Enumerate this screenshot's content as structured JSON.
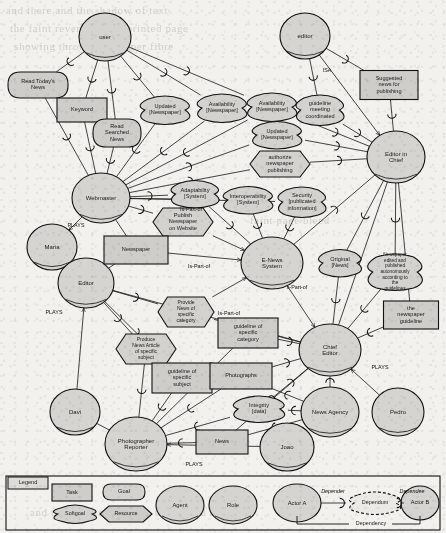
{
  "diagram": {
    "notation": "i-star",
    "colors": {
      "node_fill": "#d4d2ce",
      "stroke": "#121212",
      "page_bg": "#f2f1ee"
    }
  },
  "nodes": [
    {
      "id": "user",
      "label": "user",
      "type": "actor",
      "x": 105,
      "y": 37,
      "rx": 26,
      "ry": 24
    },
    {
      "id": "editor_role_top",
      "label": "editor",
      "type": "actor",
      "x": 305,
      "y": 36,
      "rx": 25,
      "ry": 23
    },
    {
      "id": "webmaster",
      "label": "Webmaster",
      "type": "actor",
      "x": 101,
      "y": 198,
      "rx": 29,
      "ry": 25
    },
    {
      "id": "editor_in_chief",
      "label": "Editor in\nChief",
      "type": "actor",
      "x": 396,
      "y": 157,
      "rx": 29,
      "ry": 26
    },
    {
      "id": "maria",
      "label": "Maria",
      "type": "agent",
      "x": 52,
      "y": 247,
      "rx": 25,
      "ry": 23
    },
    {
      "id": "editor_actor",
      "label": "Editor",
      "type": "actor",
      "x": 86,
      "y": 283,
      "rx": 28,
      "ry": 25
    },
    {
      "id": "enews",
      "label": "E-News\nSystem",
      "type": "actor",
      "x": 272,
      "y": 263,
      "rx": 31,
      "ry": 26
    },
    {
      "id": "chief_editor",
      "label": "Chief Editor",
      "type": "actor",
      "x": 330,
      "y": 350,
      "rx": 31,
      "ry": 26
    },
    {
      "id": "davi",
      "label": "Davi",
      "type": "agent",
      "x": 75,
      "y": 412,
      "rx": 25,
      "ry": 23
    },
    {
      "id": "photographer",
      "label": "Photographer\nReporter",
      "type": "actor",
      "x": 136,
      "y": 444,
      "rx": 31,
      "ry": 27
    },
    {
      "id": "news_agency",
      "label": "News Agency",
      "type": "actor",
      "x": 330,
      "y": 412,
      "rx": 29,
      "ry": 25
    },
    {
      "id": "pedro",
      "label": "Pedro",
      "type": "agent",
      "x": 398,
      "y": 412,
      "rx": 26,
      "ry": 24
    },
    {
      "id": "joao",
      "label": "Joao",
      "type": "agent",
      "x": 287,
      "y": 447,
      "rx": 27,
      "ry": 24
    },
    {
      "id": "read_today",
      "label": "Read Today's\nNews",
      "type": "task",
      "x": 38,
      "y": 85,
      "w": 60,
      "h": 26
    },
    {
      "id": "keyword",
      "label": "Keyword",
      "type": "resource",
      "x": 82,
      "y": 110,
      "w": 50,
      "h": 24
    },
    {
      "id": "read_searched",
      "label": "Read\nSearched\nNews",
      "type": "task",
      "x": 117,
      "y": 133,
      "w": 48,
      "h": 28
    },
    {
      "id": "updated_news_1",
      "label": "Updated\n[Newspaper]",
      "type": "softgoal",
      "x": 165,
      "y": 110,
      "w": 56,
      "h": 26
    },
    {
      "id": "avail_news_1",
      "label": "Availability\n[Newspaper]",
      "type": "softgoal",
      "x": 222,
      "y": 108,
      "w": 56,
      "h": 26
    },
    {
      "id": "avail_news_2",
      "label": "Availability\n[Newspaper]",
      "type": "softgoal",
      "x": 272,
      "y": 107,
      "w": 56,
      "h": 26
    },
    {
      "id": "updated_news_2",
      "label": "Updated\n[Newspaper]",
      "type": "softgoal",
      "x": 277,
      "y": 135,
      "w": 56,
      "h": 25
    },
    {
      "id": "guideline_meet",
      "label": "guideline\nmeeting\ncoordinated",
      "type": "softgoal",
      "x": 320,
      "y": 110,
      "w": 54,
      "h": 28
    },
    {
      "id": "suggested_news",
      "label": "Suggested\nnews for\npublishing",
      "type": "resource",
      "x": 389,
      "y": 85,
      "w": 58,
      "h": 29
    },
    {
      "id": "authorize_pub",
      "label": "authorize\nnewspaper\npublishing",
      "type": "goal",
      "x": 280,
      "y": 164,
      "w": 60,
      "h": 26
    },
    {
      "id": "adaptability",
      "label": "Adaptability\n[System]",
      "type": "softgoal",
      "x": 195,
      "y": 194,
      "w": 54,
      "h": 25
    },
    {
      "id": "interoperab",
      "label": "Interoperability\n[System]",
      "type": "softgoal",
      "x": 248,
      "y": 200,
      "w": 56,
      "h": 25
    },
    {
      "id": "security",
      "label": "Security\n[publicated\ninformation]",
      "type": "softgoal",
      "x": 302,
      "y": 202,
      "w": 54,
      "h": 28
    },
    {
      "id": "publish_web",
      "label": "Publish\nNewspaper\non Website",
      "type": "goal",
      "x": 183,
      "y": 222,
      "w": 60,
      "h": 28
    },
    {
      "id": "newspaper_res",
      "label": "Newspaper",
      "type": "resource",
      "x": 136,
      "y": 250,
      "w": 64,
      "h": 28
    },
    {
      "id": "original_news",
      "label": "Original\n[News]",
      "type": "softgoal",
      "x": 340,
      "y": 263,
      "w": 48,
      "h": 25
    },
    {
      "id": "np_autonomous",
      "label": "Newspaper edited and published autonomously according to the guidelines",
      "type": "softgoal",
      "x": 395,
      "y": 272,
      "w": 62,
      "h": 34
    },
    {
      "id": "the_np_guide",
      "label": "the\nnewspaper\nguideline",
      "type": "resource",
      "x": 411,
      "y": 315,
      "w": 55,
      "h": 28
    },
    {
      "id": "provide_news",
      "label": "Provide\nNews of\nspecific\ncategory",
      "type": "goal",
      "x": 186,
      "y": 312,
      "w": 56,
      "h": 30
    },
    {
      "id": "guide_categ",
      "label": "guideline of\nspecific\ncategory",
      "type": "resource",
      "x": 248,
      "y": 333,
      "w": 60,
      "h": 30
    },
    {
      "id": "produce_news",
      "label": "Produce\nNews Article\nof specific\nsubject",
      "type": "goal",
      "x": 146,
      "y": 349,
      "w": 60,
      "h": 30
    },
    {
      "id": "guide_subject",
      "label": "guideline of\nspecific\nsubject",
      "type": "resource",
      "x": 182,
      "y": 378,
      "w": 60,
      "h": 30
    },
    {
      "id": "photographs",
      "label": "Photographs",
      "type": "resource",
      "x": 241,
      "y": 376,
      "w": 62,
      "h": 26
    },
    {
      "id": "integrity",
      "label": "Integrity [data]",
      "type": "softgoal",
      "x": 259,
      "y": 409,
      "w": 58,
      "h": 24
    },
    {
      "id": "news_res",
      "label": "News",
      "type": "resource",
      "x": 222,
      "y": 442,
      "w": 52,
      "h": 24
    }
  ],
  "relation_labels": [
    {
      "text": "ISA",
      "x": 327,
      "y": 71
    },
    {
      "text": "PLAYS",
      "x": 76,
      "y": 226
    },
    {
      "text": "Is-Part-of",
      "x": 191,
      "y": 210
    },
    {
      "text": "Is-Part-of",
      "x": 199,
      "y": 267
    },
    {
      "text": "Is-Part-of",
      "x": 229,
      "y": 314
    },
    {
      "text": "s-Part-of",
      "x": 297,
      "y": 288
    },
    {
      "text": "PLAYS",
      "x": 54,
      "y": 313
    },
    {
      "text": "PLAYS",
      "x": 380,
      "y": 368
    },
    {
      "text": "PLAYS",
      "x": 194,
      "y": 465
    }
  ],
  "legend": {
    "title": "Legend",
    "items": [
      {
        "id": "task",
        "label": "Task"
      },
      {
        "id": "goal",
        "label": "Goal"
      },
      {
        "id": "softgoal",
        "label": "Softgoal"
      },
      {
        "id": "resource",
        "label": "Resource"
      },
      {
        "id": "agent",
        "label": "Agent"
      },
      {
        "id": "role",
        "label": "Role"
      },
      {
        "id": "actor_a",
        "label": "Actor A"
      },
      {
        "id": "dependum",
        "label": "Dependum"
      },
      {
        "id": "actor_b",
        "label": "Actor B"
      }
    ],
    "edge_labels": {
      "depender": "Depender",
      "dependee": "Dependee",
      "dependency": "Dependency"
    }
  }
}
